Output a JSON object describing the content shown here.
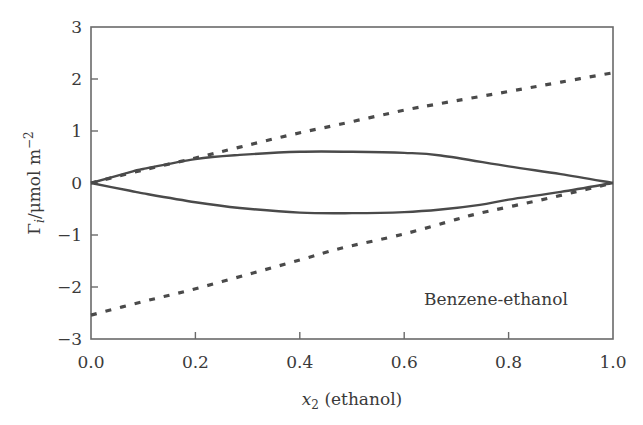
{
  "chart_data": {
    "type": "line",
    "title": "",
    "xlabel": "x2 (ethanol)",
    "xlabel_parts": {
      "var": "x",
      "sub": "2",
      "rest": " (ethanol)"
    },
    "ylabel": "Γi/μmol m−2",
    "ylabel_parts": {
      "sym": "Γ",
      "sub": "i",
      "mid": "/μmol m",
      "sup": "−2"
    },
    "xlim": [
      0.0,
      1.0
    ],
    "ylim": [
      -3,
      3
    ],
    "xticks": [
      "0.0",
      "0.2",
      "0.4",
      "0.6",
      "0.8",
      "1.0"
    ],
    "yticks": [
      "3",
      "2",
      "1",
      "0",
      "−1",
      "−2",
      "−3"
    ],
    "grid": false,
    "annotation": "Benzene-ethanol",
    "series": [
      {
        "name": "upper-solid",
        "style": "solid",
        "x": [
          0.0,
          0.075,
          0.1,
          0.2,
          0.285,
          0.4,
          0.5,
          0.6,
          0.67,
          0.8,
          0.9,
          1.0
        ],
        "y": [
          0.0,
          0.21,
          0.27,
          0.46,
          0.54,
          0.6,
          0.6,
          0.58,
          0.53,
          0.32,
          0.17,
          0.0
        ]
      },
      {
        "name": "lower-solid",
        "style": "solid",
        "x": [
          0.0,
          0.075,
          0.1,
          0.2,
          0.285,
          0.4,
          0.5,
          0.6,
          0.67,
          0.745,
          0.8,
          0.9,
          1.0
        ],
        "y": [
          0.0,
          -0.15,
          -0.2,
          -0.37,
          -0.48,
          -0.57,
          -0.58,
          -0.56,
          -0.51,
          -0.42,
          -0.32,
          -0.17,
          0.0
        ]
      },
      {
        "name": "upper-dashed",
        "style": "dashed",
        "x": [
          0.0,
          0.1,
          0.2,
          0.285,
          0.38,
          0.477,
          0.6,
          0.67,
          0.8,
          0.9,
          1.0
        ],
        "y": [
          0.0,
          0.25,
          0.48,
          0.69,
          0.92,
          1.13,
          1.4,
          1.53,
          1.76,
          1.94,
          2.12
        ]
      },
      {
        "name": "lower-dashed",
        "style": "dashed",
        "x": [
          0.0,
          0.1,
          0.19,
          0.3,
          0.4,
          0.477,
          0.6,
          0.7,
          0.745,
          0.86,
          0.95,
          1.0
        ],
        "y": [
          -2.54,
          -2.28,
          -2.06,
          -1.76,
          -1.48,
          -1.26,
          -0.98,
          -0.7,
          -0.58,
          -0.33,
          -0.12,
          0.0
        ]
      }
    ]
  }
}
